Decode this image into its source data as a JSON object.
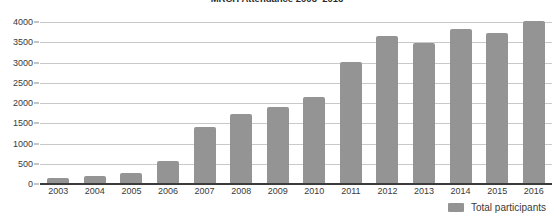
{
  "chart_data": {
    "type": "bar",
    "title": "MRCH Attendance 2003–2016",
    "xlabel": "",
    "ylabel": "",
    "ylim": [
      0,
      4250
    ],
    "ytick_step": 500,
    "yticks": [
      0,
      500,
      1000,
      1500,
      2000,
      2500,
      3000,
      3500,
      4000
    ],
    "ytick_labels": [
      "0",
      "500",
      "1000",
      "1500",
      "2000",
      "2500",
      "3000",
      "3500",
      "4000"
    ],
    "categories": [
      "2003",
      "2004",
      "2005",
      "2006",
      "2007",
      "2008",
      "2009",
      "2010",
      "2011",
      "2012",
      "2013",
      "2014",
      "2015",
      "2016"
    ],
    "series": [
      {
        "name": "Total participants",
        "color": "#949494",
        "values": [
          150,
          190,
          260,
          560,
          1400,
          1720,
          1910,
          2150,
          3010,
          3650,
          3490,
          3840,
          3740,
          4040
        ]
      }
    ],
    "grid": true,
    "grid_axis": "y",
    "grid_color": "#c9c9c9",
    "legend": true,
    "legend_position": "bottom-right",
    "bar_color": "#949494",
    "axis_color": "#3b3b3b"
  },
  "legend": {
    "entries": [
      {
        "label": "Total participants",
        "color": "#949494"
      }
    ]
  }
}
